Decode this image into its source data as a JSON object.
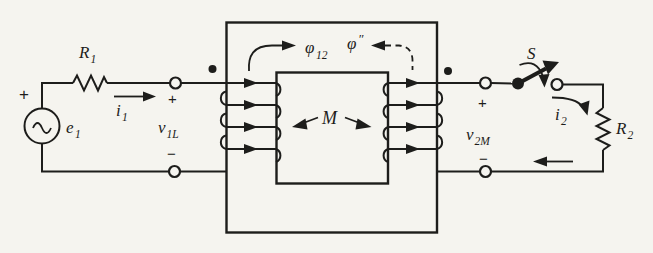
{
  "diagram": {
    "kind": "mutual-inductance-transformer-circuit",
    "left_circuit": {
      "source_polarity": "+",
      "source": {
        "base": "e",
        "sub": "1"
      },
      "resistor": {
        "base": "R",
        "sub": "1"
      },
      "current": {
        "base": "i",
        "sub": "1"
      },
      "voltage": {
        "base": "v",
        "sub": "1L"
      },
      "terminal_plus": "+",
      "terminal_minus": "−"
    },
    "core": {
      "flux_coupling": {
        "base": "φ",
        "sub": "12"
      },
      "flux_secondary": {
        "base": "φ",
        "sup": "″"
      },
      "mutual_inductance": "M"
    },
    "right_circuit": {
      "switch": "S",
      "current": {
        "base": "i",
        "sub": "2"
      },
      "resistor": {
        "base": "R",
        "sub": "2"
      },
      "voltage": {
        "base": "v",
        "sub": "2M"
      },
      "terminal_plus": "+",
      "terminal_minus": "−"
    }
  },
  "colors": {
    "ink": "#1d1d1b",
    "paper": "#f5f4ef"
  }
}
